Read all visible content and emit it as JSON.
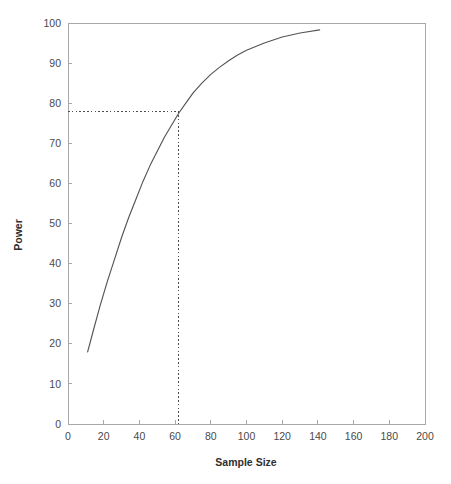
{
  "chart_data": {
    "type": "line",
    "title": "",
    "subtitle": "",
    "xlabel": "Sample Size",
    "ylabel": "Power",
    "xlim": [
      0,
      200
    ],
    "ylim": [
      0,
      100
    ],
    "xticks": [
      0,
      20,
      40,
      60,
      80,
      100,
      120,
      140,
      160,
      180,
      200
    ],
    "yticks": [
      0,
      10,
      20,
      30,
      40,
      50,
      60,
      70,
      80,
      90,
      100
    ],
    "xtick_labels": [
      "0",
      "20",
      "40",
      "60",
      "80",
      "100",
      "120",
      "140",
      "160",
      "180",
      "200"
    ],
    "ytick_labels": [
      "0",
      "10",
      "20",
      "30",
      "40",
      "50",
      "60",
      "70",
      "80",
      "90",
      "100"
    ],
    "grid": false,
    "legend": false,
    "legend_position": "none",
    "series": [
      {
        "name": "Power curve",
        "color": "#555555",
        "x": [
          11,
          14,
          18,
          22,
          26,
          30,
          34,
          38,
          42,
          46,
          50,
          54,
          58,
          62,
          66,
          70,
          75,
          80,
          85,
          90,
          95,
          100,
          110,
          120,
          130,
          141
        ],
        "y": [
          18.0,
          23.0,
          29.5,
          35.5,
          41.0,
          46.5,
          51.5,
          56.0,
          60.5,
          64.5,
          68.0,
          71.5,
          74.5,
          77.5,
          80.0,
          82.5,
          85.0,
          87.2,
          89.0,
          90.6,
          92.0,
          93.2,
          95.0,
          96.5,
          97.5,
          98.3
        ]
      }
    ],
    "annotations": [
      {
        "name": "power-reference-lines",
        "kind": "dotted-crosshair",
        "x": 62,
        "y": 78,
        "horizontal_from_x": 0,
        "vertical_to_y": 0,
        "color": "#4d4d4d"
      }
    ]
  },
  "axes": {
    "x_title": "Sample Size",
    "y_title": "Power"
  },
  "colors": {
    "background": "#ffffff",
    "frame": "#a8a8a8",
    "series": "#555555",
    "reference": "#4d4d4d",
    "text": "#4a4a4a"
  }
}
